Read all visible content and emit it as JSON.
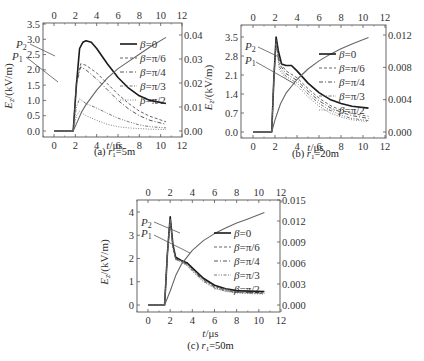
{
  "chart_data": [
    {
      "id": "a",
      "type": "line",
      "caption": "(a) r1=5m",
      "caption_prefix": "(a) ",
      "caption_var": "r",
      "caption_sub": "1",
      "caption_suffix": "=5m",
      "xlabel": "t/μs",
      "ylabel": "Ez/(kV/m)",
      "xticks": [
        0,
        2,
        4,
        6,
        8,
        10,
        12
      ],
      "top_xticks": [
        0,
        2,
        4,
        6,
        8,
        10,
        12
      ],
      "yticks": [
        "0.0",
        "0.5",
        "1.0",
        "1.5",
        "2.0",
        "2.5",
        "3.0",
        "3.5"
      ],
      "ylim": [
        0,
        3.5
      ],
      "xlim": [
        -1,
        12
      ],
      "right_yticks": [
        "0.00",
        "0.01",
        "0.02",
        "0.03",
        "0.04"
      ],
      "right_ylim": [
        0,
        0.04
      ],
      "annotations": [
        "P2",
        "P1"
      ],
      "legend": [
        "β=0",
        "β=π/6",
        "β=π/4",
        "β=π/3",
        "β=π/2"
      ],
      "series": [
        {
          "name": "β=0",
          "style": "solid-thick",
          "x": [
            0,
            1.8,
            2.1,
            2.4,
            2.7,
            3.0,
            3.5,
            4.0,
            5.0,
            6.0,
            7.0,
            8.0,
            9.0,
            10.5
          ],
          "y": [
            0,
            0,
            1.5,
            2.7,
            2.9,
            2.95,
            2.9,
            2.7,
            2.2,
            1.75,
            1.4,
            1.15,
            1.0,
            0.9
          ]
        },
        {
          "name": "β=π/6",
          "style": "dashed",
          "x": [
            0,
            1.8,
            2.1,
            2.5,
            3.0,
            4.0,
            5.0,
            6.0,
            7.0,
            8.0,
            9.0,
            10.5
          ],
          "y": [
            0,
            0,
            1.6,
            2.2,
            2.15,
            1.9,
            1.55,
            1.2,
            0.9,
            0.65,
            0.48,
            0.3
          ]
        },
        {
          "name": "β=π/4",
          "style": "dashdot",
          "x": [
            0,
            1.8,
            2.1,
            2.5,
            3.0,
            4.0,
            5.0,
            6.0,
            7.0,
            8.0,
            9.0,
            10.5
          ],
          "y": [
            0,
            0,
            1.5,
            2.1,
            2.0,
            1.7,
            1.35,
            1.0,
            0.72,
            0.5,
            0.35,
            0.22
          ]
        },
        {
          "name": "β=π/3",
          "style": "dash-dot-dot",
          "x": [
            0,
            1.8,
            2.1,
            2.4,
            3.0,
            4.0,
            5.0,
            6.0,
            7.0,
            8.0,
            9.0,
            10.5
          ],
          "y": [
            0,
            0,
            0.8,
            1.05,
            0.9,
            0.75,
            0.58,
            0.42,
            0.3,
            0.2,
            0.14,
            0.1
          ]
        },
        {
          "name": "β=π/2",
          "style": "dotted",
          "x": [
            0,
            1.8,
            2.1,
            2.4,
            3.0,
            4.0,
            5.0,
            6.0,
            7.0,
            8.0,
            9.0,
            10.5
          ],
          "y": [
            0,
            0,
            0.5,
            0.65,
            0.5,
            0.35,
            0.22,
            0.14,
            0.1,
            0.08,
            0.06,
            0.05
          ]
        },
        {
          "name": "integral (right axis)",
          "style": "solid-grey",
          "axis": "right",
          "x": [
            0,
            1.8,
            2.2,
            2.6,
            3.0,
            4.0,
            5.0,
            6.0,
            7.0,
            8.0,
            9.0,
            10.5
          ],
          "y": [
            0,
            0,
            0.004,
            0.008,
            0.011,
            0.017,
            0.022,
            0.026,
            0.029,
            0.032,
            0.035,
            0.039
          ]
        }
      ]
    },
    {
      "id": "b",
      "type": "line",
      "caption": "(b) r1=20m",
      "caption_prefix": "(b) ",
      "caption_var": "r",
      "caption_sub": "1",
      "caption_suffix": "=20m",
      "xlabel": "t/μs",
      "ylabel": "Ez/(kV/m)",
      "xticks": [
        0,
        2,
        4,
        6,
        8,
        10,
        12
      ],
      "top_xticks": [
        0,
        2,
        4,
        6,
        8,
        10,
        12
      ],
      "yticks": [
        "0.0",
        "0.7",
        "1.4",
        "2.1",
        "2.8",
        "3.5"
      ],
      "ylim": [
        0,
        3.5
      ],
      "xlim": [
        -1,
        12
      ],
      "right_yticks": [
        "0.000",
        "0.004",
        "0.008",
        "0.012"
      ],
      "right_ylim": [
        0,
        0.012
      ],
      "annotations": [
        "P2",
        "P1"
      ],
      "legend": [
        "β=0",
        "β=π/6",
        "β=π/4",
        "β=π/3",
        "β=π/2"
      ],
      "series": [
        {
          "name": "β=0",
          "style": "solid-thick",
          "x": [
            0,
            1.7,
            1.9,
            2.1,
            2.3,
            2.6,
            3.0,
            3.5,
            4.0,
            5.0,
            6.0,
            7.0,
            8.0,
            9.0,
            10.5
          ],
          "y": [
            0,
            0,
            2.0,
            3.5,
            3.0,
            2.5,
            2.45,
            2.45,
            2.25,
            1.8,
            1.45,
            1.2,
            1.05,
            0.95,
            0.88
          ]
        },
        {
          "name": "β=π/6",
          "style": "dashed",
          "x": [
            0,
            1.7,
            1.9,
            2.1,
            2.4,
            3.0,
            4.0,
            5.0,
            6.0,
            7.0,
            8.0,
            9.0,
            10.5
          ],
          "y": [
            0,
            0,
            2.0,
            3.4,
            2.6,
            2.25,
            2.0,
            1.6,
            1.25,
            0.98,
            0.8,
            0.68,
            0.58
          ]
        },
        {
          "name": "β=π/4",
          "style": "dashdot",
          "x": [
            0,
            1.7,
            1.9,
            2.1,
            2.4,
            3.0,
            4.0,
            5.0,
            6.0,
            7.0,
            8.0,
            9.0,
            10.5
          ],
          "y": [
            0,
            0,
            2.0,
            3.35,
            2.5,
            2.15,
            1.9,
            1.5,
            1.15,
            0.9,
            0.73,
            0.6,
            0.5
          ]
        },
        {
          "name": "β=π/3",
          "style": "dash-dot-dot",
          "x": [
            0,
            1.7,
            1.9,
            2.1,
            2.4,
            3.0,
            4.0,
            5.0,
            6.0,
            7.0,
            8.0,
            9.0,
            10.5
          ],
          "y": [
            0,
            0,
            2.0,
            3.3,
            2.4,
            2.05,
            1.8,
            1.4,
            1.05,
            0.8,
            0.62,
            0.5,
            0.42
          ]
        },
        {
          "name": "β=π/2",
          "style": "dotted",
          "x": [
            0,
            1.7,
            1.9,
            2.1,
            2.4,
            3.0,
            4.0,
            5.0,
            6.0,
            7.0,
            8.0,
            9.0,
            10.5
          ],
          "y": [
            0,
            0,
            2.0,
            3.25,
            2.3,
            1.95,
            1.7,
            1.3,
            0.95,
            0.7,
            0.55,
            0.45,
            0.38
          ]
        },
        {
          "name": "integral (right axis)",
          "style": "solid-grey",
          "axis": "right",
          "x": [
            0,
            1.7,
            2.0,
            2.5,
            3.0,
            4.0,
            5.0,
            6.0,
            7.0,
            8.0,
            9.0,
            10.5
          ],
          "y": [
            0,
            0,
            0.0015,
            0.0035,
            0.0048,
            0.0065,
            0.0078,
            0.0088,
            0.0096,
            0.0103,
            0.0109,
            0.0117
          ]
        }
      ]
    },
    {
      "id": "c",
      "type": "line",
      "caption": "(c) r1=50m",
      "caption_prefix": "(c) ",
      "caption_var": "r",
      "caption_sub": "1",
      "caption_suffix": "=50m",
      "xlabel": "t/μs",
      "ylabel": "Ez/(kV/m)",
      "xticks": [
        0,
        2,
        4,
        6,
        8,
        10,
        12
      ],
      "top_xticks": [
        0,
        2,
        4,
        6,
        8,
        10,
        12
      ],
      "yticks": [
        "0",
        "1",
        "2",
        "3",
        "4"
      ],
      "ylim": [
        0,
        4
      ],
      "xlim": [
        -1,
        12
      ],
      "right_yticks": [
        "0.000",
        "0.003",
        "0.006",
        "0.009",
        "0.012",
        "0.015"
      ],
      "right_ylim": [
        0,
        0.015
      ],
      "annotations": [
        "P2",
        "P1"
      ],
      "legend": [
        "β=0",
        "β=π/6",
        "β=π/4",
        "β=π/3",
        "β=π/2"
      ],
      "series": [
        {
          "name": "β=0",
          "style": "solid-thick",
          "x": [
            0,
            1.5,
            1.75,
            2.0,
            2.25,
            2.5,
            3.0,
            3.5,
            4.0,
            5.0,
            6.0,
            7.0,
            8.0,
            9.0,
            10.5
          ],
          "y": [
            0,
            0,
            2.2,
            3.8,
            2.6,
            2.05,
            1.92,
            1.82,
            1.6,
            1.15,
            0.85,
            0.7,
            0.62,
            0.6,
            0.58
          ]
        },
        {
          "name": "β=π/6",
          "style": "dashed",
          "x": [
            0,
            1.5,
            1.75,
            2.0,
            2.25,
            2.5,
            3.0,
            3.5,
            4.0,
            5.0,
            6.0,
            7.0,
            8.0,
            9.0,
            10.5
          ],
          "y": [
            0,
            0,
            2.2,
            3.75,
            2.55,
            2.0,
            1.9,
            1.78,
            1.55,
            1.1,
            0.8,
            0.66,
            0.58,
            0.55,
            0.53
          ]
        },
        {
          "name": "β=π/4",
          "style": "dashdot",
          "x": [
            0,
            1.5,
            1.75,
            2.0,
            2.25,
            2.5,
            3.0,
            3.5,
            4.0,
            5.0,
            6.0,
            7.0,
            8.0,
            9.0,
            10.5
          ],
          "y": [
            0,
            0,
            2.2,
            3.72,
            2.5,
            1.98,
            1.88,
            1.75,
            1.52,
            1.07,
            0.78,
            0.63,
            0.56,
            0.53,
            0.51
          ]
        },
        {
          "name": "β=π/3",
          "style": "dash-dot-dot",
          "x": [
            0,
            1.5,
            1.75,
            2.0,
            2.25,
            2.5,
            3.0,
            3.5,
            4.0,
            5.0,
            6.0,
            7.0,
            8.0,
            9.0,
            10.5
          ],
          "y": [
            0,
            0,
            2.2,
            3.7,
            2.48,
            1.96,
            1.86,
            1.72,
            1.48,
            1.03,
            0.75,
            0.6,
            0.54,
            0.51,
            0.49
          ]
        },
        {
          "name": "β=π/2",
          "style": "dotted",
          "x": [
            0,
            1.5,
            1.75,
            2.0,
            2.25,
            2.5,
            3.0,
            3.5,
            4.0,
            5.0,
            6.0,
            7.0,
            8.0,
            9.0,
            10.5
          ],
          "y": [
            0,
            0,
            2.2,
            3.68,
            2.45,
            1.94,
            1.84,
            1.7,
            1.45,
            1.0,
            0.72,
            0.58,
            0.52,
            0.49,
            0.47
          ]
        },
        {
          "name": "integral (right axis)",
          "style": "solid-grey",
          "axis": "right",
          "x": [
            0,
            1.5,
            2.0,
            2.5,
            3.0,
            4.0,
            5.0,
            6.0,
            7.0,
            8.0,
            9.0,
            10.5
          ],
          "y": [
            0,
            0,
            0.002,
            0.0042,
            0.0058,
            0.0078,
            0.0092,
            0.0102,
            0.011,
            0.0117,
            0.0123,
            0.0132
          ]
        }
      ]
    }
  ]
}
